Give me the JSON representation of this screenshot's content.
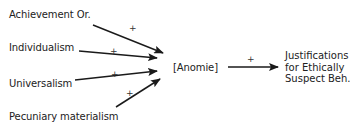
{
  "diagram": {
    "predictors": [
      {
        "label": "Achievement Or.",
        "sign": "+"
      },
      {
        "label": "Individualism",
        "sign": "+"
      },
      {
        "label": "Universalism",
        "sign": "+"
      },
      {
        "label": "Pecuniary materialism",
        "sign": "+"
      }
    ],
    "mediator": {
      "label": "[Anomie]"
    },
    "mediator_to_outcome_sign": "+",
    "outcome": {
      "lines": [
        "Justifications",
        "for Ethically",
        "Suspect Beh."
      ]
    },
    "colors": {
      "line": "#1a1a1a",
      "text": "#222222",
      "background": "#ffffff"
    }
  }
}
